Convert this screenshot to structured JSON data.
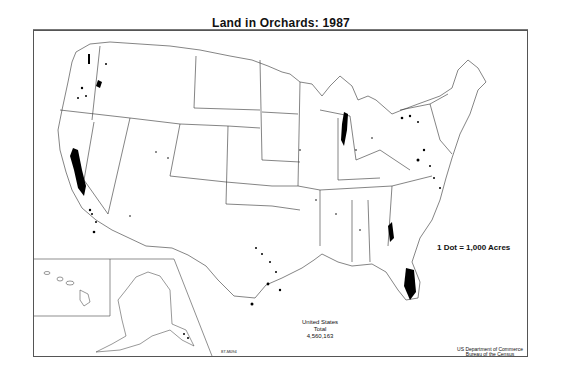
{
  "map": {
    "title": "Land in Orchards: 1987",
    "legend": {
      "label": "1 Dot = 1,000 Acres"
    },
    "total": {
      "line1": "United States",
      "line2": "Total",
      "value": "4,560,163"
    },
    "source": {
      "line1": "US Department of Commerce",
      "line2": "Bureau of the Census"
    },
    "map_id": "87-M094",
    "insets": [
      "Alaska",
      "Hawaii"
    ],
    "colors": {
      "background": "#ffffff",
      "lines": "#333333",
      "dots": "#000000"
    },
    "concentrations": [
      "California Central Valley",
      "Washington (Yakima/Wenatchee)",
      "Oregon (Willamette/Hood River)",
      "Michigan (western shore)",
      "Florida (central)",
      "Georgia (south-central)",
      "Texas (central/Rio Grande)",
      "Mid-Atlantic (PA/VA/MD)",
      "New York (Lake Ontario shore)"
    ]
  }
}
